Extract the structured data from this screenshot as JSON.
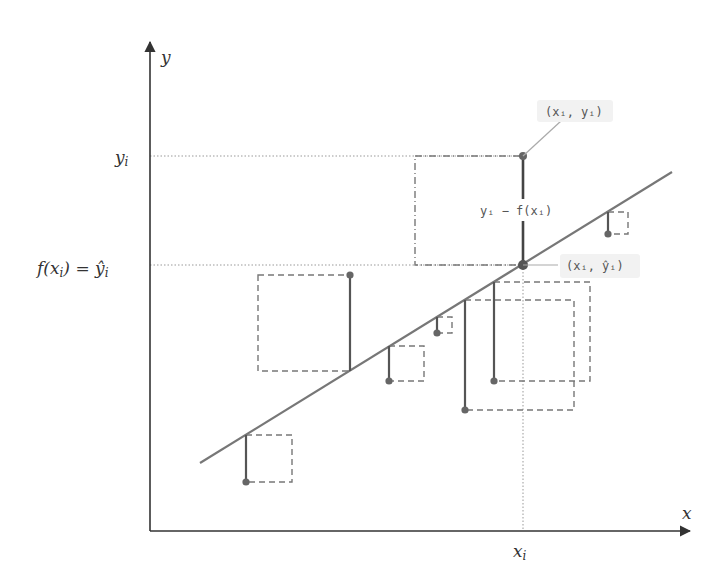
{
  "diagram": {
    "title": "",
    "type": "least-squares regression residual diagram",
    "colors": {
      "axis": "#333333",
      "regression_line": "#777777",
      "residual_segment": "#555555",
      "point": "#666666",
      "square_dashed": "#777777",
      "guide_dotted": "#999999",
      "leader_line": "#aaaaaa",
      "tag_background": "#f2f2f2"
    },
    "axes": {
      "x_label": "x",
      "y_label": "y",
      "origin": [
        150,
        531
      ],
      "x_end": [
        690,
        531
      ],
      "y_end": [
        150,
        42
      ]
    },
    "tick_labels": {
      "x_i": {
        "text": "x",
        "sub": "i"
      },
      "y_i": {
        "text": "y",
        "sub": "i"
      },
      "f_xi": {
        "pre": "f(x",
        "sub": "i",
        "mid": ") = ŷ",
        "sub2": "i"
      }
    },
    "annotations": {
      "point_label": "(xᵢ, yᵢ)",
      "fitted_label": "(xᵢ, ŷᵢ)",
      "residual_label": "yᵢ − f(xᵢ)"
    },
    "regression_line": {
      "x1": 200,
      "y1": 463,
      "x2": 672,
      "y2": 172
    },
    "highlight": {
      "point": [
        523,
        156
      ],
      "fitted": [
        523,
        265
      ],
      "square": {
        "x": 415,
        "y": 156,
        "w": 108,
        "h": 109
      }
    },
    "residuals": [
      {
        "x": 246,
        "y_line": 435,
        "y_point": 482,
        "square": {
          "x": 246,
          "y": 435,
          "w": 46,
          "h": 47
        }
      },
      {
        "x": 350,
        "y_line": 371,
        "y_point": 275,
        "square": {
          "x": 258,
          "y": 275,
          "w": 92,
          "h": 96
        }
      },
      {
        "x": 389,
        "y_line": 346,
        "y_point": 381,
        "square": {
          "x": 389,
          "y": 346,
          "w": 35,
          "h": 35
        }
      },
      {
        "x": 437,
        "y_line": 317,
        "y_point": 333,
        "square": {
          "x": 437,
          "y": 317,
          "w": 15,
          "h": 16
        }
      },
      {
        "x": 465,
        "y_line": 300,
        "y_point": 410,
        "square": {
          "x": 465,
          "y": 300,
          "w": 109,
          "h": 110
        }
      },
      {
        "x": 494,
        "y_line": 282,
        "y_point": 381,
        "square": {
          "x": 494,
          "y": 282,
          "w": 96,
          "h": 99
        }
      },
      {
        "x": 608,
        "y_line": 212,
        "y_point": 234,
        "square": {
          "x": 608,
          "y": 212,
          "w": 20,
          "h": 22
        }
      }
    ]
  }
}
